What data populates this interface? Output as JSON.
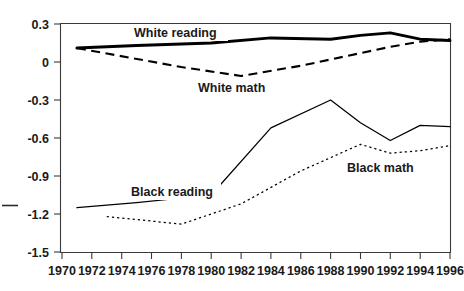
{
  "chart_data": {
    "type": "line",
    "title": "",
    "subtitle": "",
    "xlabel": "",
    "ylabel": "",
    "xlim": [
      1970,
      1996
    ],
    "ylim": [
      -1.5,
      0.3
    ],
    "grid": false,
    "legend_position": "inline-annotations",
    "x_ticks": [
      "1970",
      "1972",
      "1974",
      "1976",
      "1978",
      "1980",
      "1982",
      "1984",
      "1986",
      "1988",
      "1990",
      "1992",
      "1994",
      "1996"
    ],
    "y_ticks": [
      "0.3",
      "0",
      "-0.3",
      "-0.6",
      "-0.9",
      "-1.2",
      "-1.5"
    ],
    "series": [
      {
        "name": "White reading",
        "style": "thick-solid",
        "x": [
          1971,
          1975,
          1980,
          1984,
          1988,
          1990,
          1992,
          1994,
          1996
        ],
        "values": [
          0.11,
          0.13,
          0.15,
          0.19,
          0.18,
          0.21,
          0.23,
          0.18,
          0.17
        ]
      },
      {
        "name": "White math",
        "style": "dashed",
        "x": [
          1971,
          1978,
          1982,
          1986,
          1990,
          1992,
          1994,
          1996
        ],
        "values": [
          0.11,
          -0.04,
          -0.11,
          -0.03,
          0.07,
          0.12,
          0.16,
          0.18
        ]
      },
      {
        "name": "Black reading",
        "style": "thin-solid",
        "x": [
          1971,
          1975,
          1980,
          1984,
          1988,
          1990,
          1992,
          1994,
          1996
        ],
        "values": [
          -1.15,
          -1.11,
          -1.05,
          -0.52,
          -0.3,
          -0.48,
          -0.62,
          -0.5,
          -0.51
        ]
      },
      {
        "name": "Black math",
        "style": "dotted",
        "x": [
          1973,
          1978,
          1982,
          1986,
          1990,
          1992,
          1994,
          1996
        ],
        "values": [
          -1.22,
          -1.28,
          -1.12,
          -0.86,
          -0.65,
          -0.72,
          -0.7,
          -0.66
        ]
      }
    ],
    "annotations": [
      {
        "text": "White reading",
        "x": 1978,
        "y": 0.27
      },
      {
        "text": "White math",
        "x": 1983,
        "y": -0.19
      },
      {
        "text": "Black reading",
        "x": 1978,
        "y": -0.95
      },
      {
        "text": "Black math",
        "x": 1992,
        "y": -0.79
      }
    ]
  },
  "axis": {
    "y_labels": [
      "0.3",
      "0",
      "-0.3",
      "-0.6",
      "-0.9",
      "-1.2",
      "-1.5"
    ],
    "x_labels": [
      "1970",
      "1972",
      "1974",
      "1976",
      "1978",
      "1980",
      "1982",
      "1984",
      "1986",
      "1988",
      "1990",
      "1992",
      "1994",
      "1996"
    ]
  },
  "labels": {
    "white_reading": "White reading",
    "white_math": "White math",
    "black_reading": "Black reading",
    "black_math": "Black math"
  }
}
